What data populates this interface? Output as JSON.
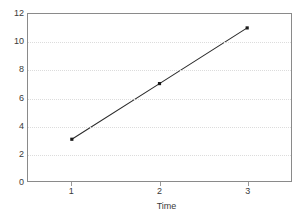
{
  "chart_data": {
    "type": "line",
    "title": "",
    "xlabel": "Time",
    "ylabel": "",
    "categories": [
      "1",
      "2",
      "3"
    ],
    "x": [
      1,
      2,
      3
    ],
    "values": [
      3,
      7,
      11
    ],
    "series": [
      {
        "name": "",
        "values": [
          3,
          7,
          11
        ]
      }
    ],
    "xlim": [
      0.5,
      3.5
    ],
    "ylim": [
      0,
      12
    ],
    "yticks": [
      0,
      2,
      4,
      6,
      8,
      10,
      12
    ],
    "ytick_labels": [
      "0",
      "2",
      "4",
      "6",
      "8",
      "10",
      "12"
    ],
    "xticks": [
      1,
      2,
      3
    ],
    "xtick_labels": [
      "1",
      "2",
      "3"
    ],
    "grid": true,
    "grid_axis": "y",
    "legend": false,
    "marker": "square",
    "colors": {
      "line": "#2b2b2b",
      "marker": "#1a1a1a",
      "gridline": "#dcdcdc",
      "frame": "#8a8a8a",
      "text": "#3a3a3a",
      "background": "#ffffff"
    }
  }
}
